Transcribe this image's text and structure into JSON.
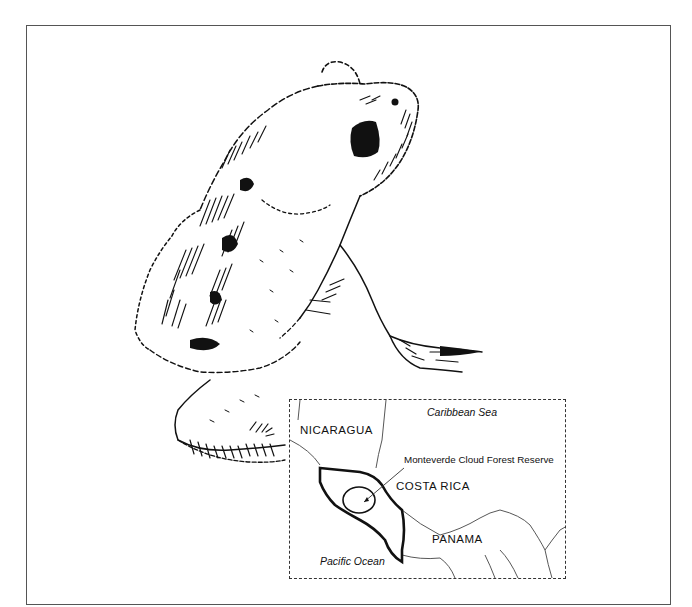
{
  "illustration": {
    "subject": "frog-line-drawing",
    "style": "pen-and-ink stippled hatching",
    "stroke_color": "#111111",
    "background_color": "#ffffff",
    "frame_color": "#555555"
  },
  "map_inset": {
    "labels": {
      "nicaragua": "NICARAGUA",
      "caribbean": "Caribbean Sea",
      "reserve": "Monteverde Cloud Forest Reserve",
      "costa_rica": "COSTA RICA",
      "panama": "PANAMA",
      "pacific": "Pacific Ocean"
    },
    "highlighted_country": "COSTA RICA",
    "border_style": "dashed"
  }
}
